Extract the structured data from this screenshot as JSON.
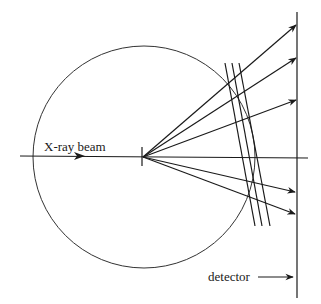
{
  "diagram": {
    "labels": {
      "beam": "X-ray beam",
      "detector": "detector"
    },
    "colors": {
      "stroke": "#1a1a1a",
      "background": "#ffffff"
    },
    "elements": {
      "ewald_sphere": "circle",
      "incident_beam": "horizontal arrow through circle",
      "diffracted_beams": 5,
      "lattice_planes": 3,
      "detector_plane": "vertical line"
    }
  }
}
